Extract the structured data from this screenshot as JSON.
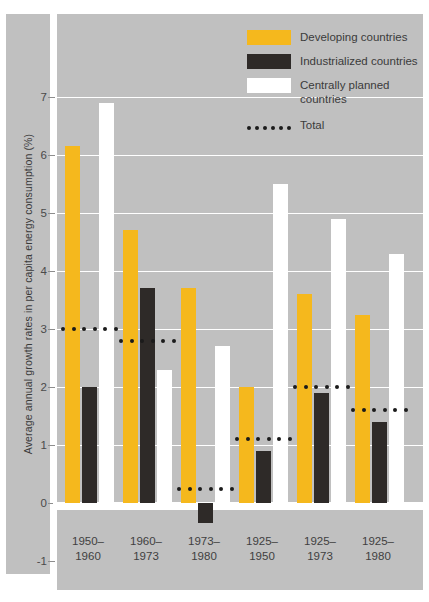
{
  "chart_data": {
    "type": "bar",
    "title": "",
    "xlabel": "",
    "ylabel": "Average annual growth rates in per capita energy consumption (%)",
    "categories": [
      "1950–\n1960",
      "1960–\n1973",
      "1973–\n1980",
      "1925–\n1950",
      "1925–\n1973",
      "1925–\n1980"
    ],
    "category_lines": [
      [
        "1950–",
        "1960"
      ],
      [
        "1960–",
        "1973"
      ],
      [
        "1973–",
        "1980"
      ],
      [
        "1925–",
        "1950"
      ],
      [
        "1925–",
        "1973"
      ],
      [
        "1925–",
        "1980"
      ]
    ],
    "ylim": [
      -1,
      7.6
    ],
    "yticks": [
      -1,
      0,
      1,
      2,
      3,
      4,
      5,
      6,
      7
    ],
    "ytick_labels": [
      "-1",
      "0",
      "1",
      "2",
      "3",
      "4",
      "5",
      "6",
      "7"
    ],
    "grid": true,
    "legend_position": "top-right",
    "series": [
      {
        "name": "Developing countries",
        "color": "#f5b81d",
        "values": [
          6.15,
          4.7,
          3.7,
          2.0,
          3.6,
          3.25
        ]
      },
      {
        "name": "Industrialized countries",
        "color": "#2e2a28",
        "values": [
          2.0,
          3.7,
          -0.35,
          0.9,
          1.9,
          1.4
        ]
      },
      {
        "name": "Centrally planned countries",
        "color": "#ffffff",
        "values": [
          6.9,
          2.3,
          2.7,
          5.5,
          4.9,
          4.3
        ]
      }
    ],
    "total_markers": {
      "name": "Total",
      "color": "#1b1b1b",
      "values": [
        3.0,
        2.8,
        0.25,
        1.1,
        2.0,
        1.6
      ]
    }
  },
  "legend": {
    "items": [
      {
        "label": "Developing countries",
        "swatch": "solid-yellow"
      },
      {
        "label": "Industrialized countries",
        "swatch": "solid-dark"
      },
      {
        "label": "Centrally planned countries",
        "swatch": "solid-white"
      },
      {
        "label": "Total",
        "swatch": "dotted-line"
      }
    ],
    "centrally_line1": "Centrally planned",
    "centrally_line2": "countries"
  },
  "colors": {
    "developing": "#f5b81d",
    "industrialized": "#2e2a28",
    "centrally_planned": "#ffffff",
    "total_dots": "#1b1b1b",
    "panel_background": "#c0c0c0",
    "page_background": "#ffffff",
    "gridline": "#ffffff"
  }
}
